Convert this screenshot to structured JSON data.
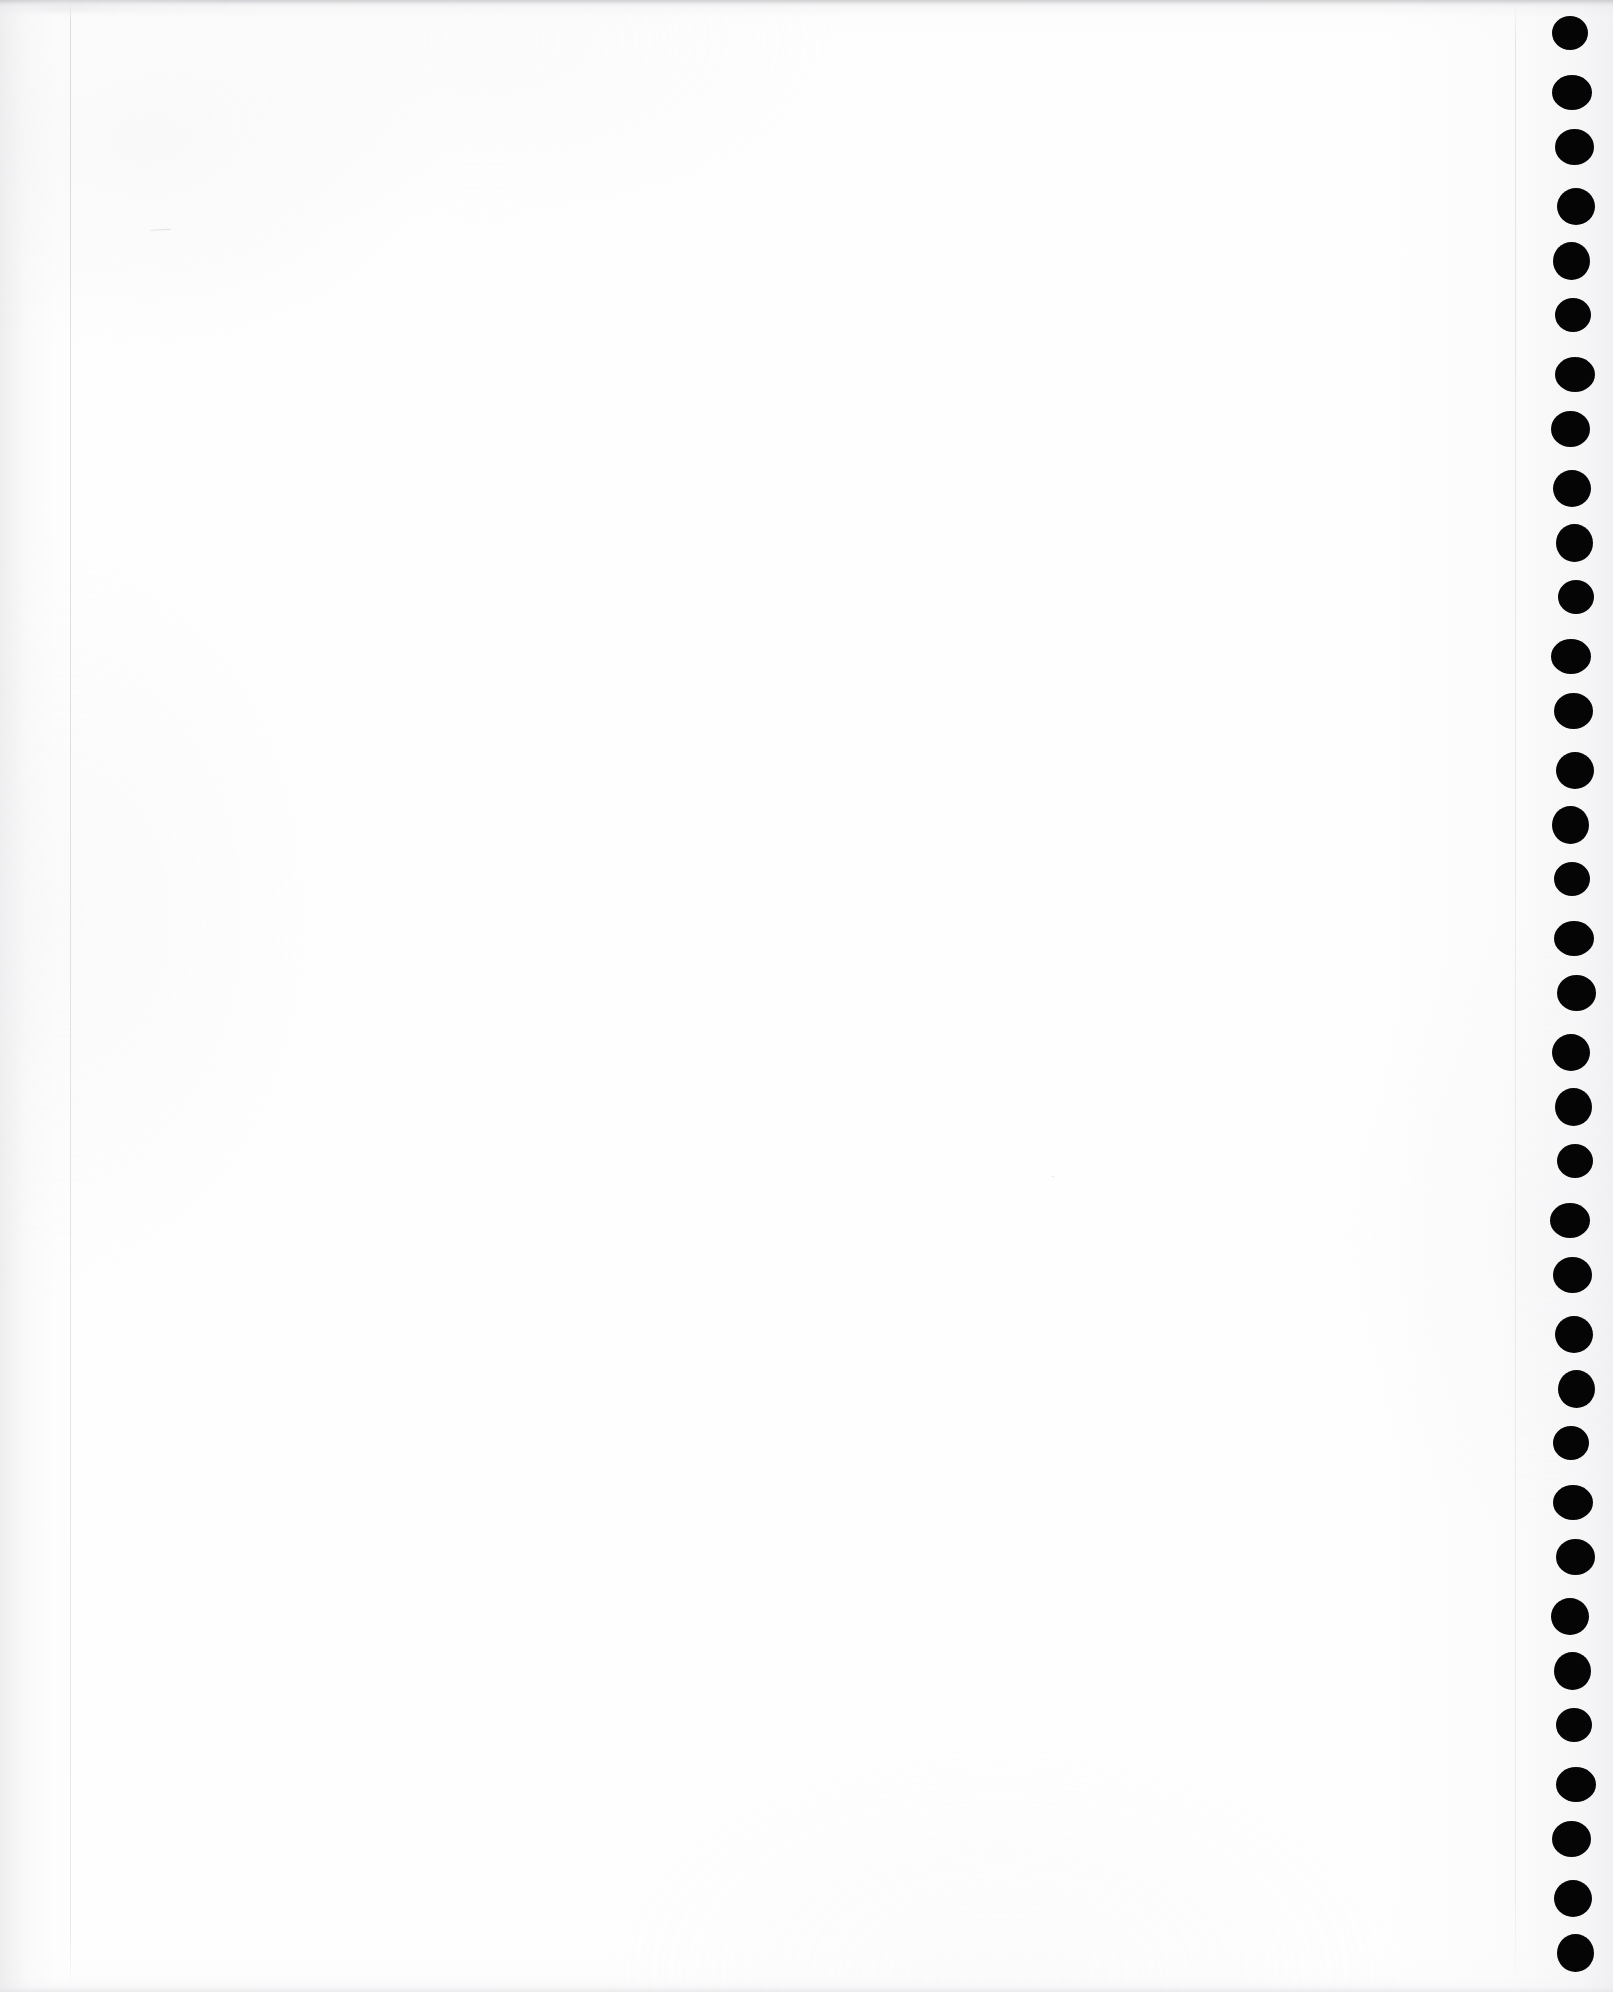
{
  "document": {
    "kind": "scanned-page",
    "page_state": "blank",
    "page_width_px": 1613,
    "page_height_px": 1992,
    "visible_text": "",
    "caption": "Blank scanned notebook page with punched binding holes along the right margin"
  },
  "colors": {
    "page_background": "#fefefe",
    "canvas_background": "#ffffff",
    "hole_fill": "#050505",
    "rule_line": "#d6d6da",
    "edge_shadow": "#c4c4c8",
    "bleed_mark": "#96969b"
  },
  "binding": {
    "edge": "right",
    "hole_count": 35,
    "hole_center_x": 1573,
    "hole_diameter_w": 38,
    "hole_diameter_h": 36,
    "first_hole_center_y": 35,
    "hole_spacing_y": 56.4,
    "perforation_line_x": 1515
  },
  "page_edges": {
    "left_margin_line_x": 70,
    "top_shadow_height": 4,
    "bottom_shadow_height": 5
  },
  "artifacts": {
    "upper_speck": "⸺",
    "lower_speck": "˜"
  }
}
